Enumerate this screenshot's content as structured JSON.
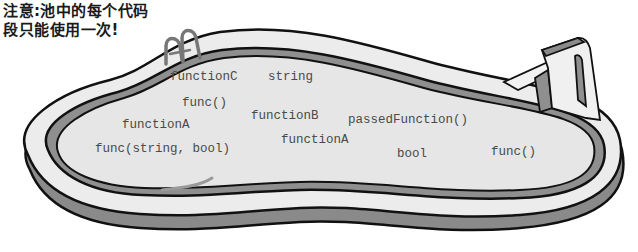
{
  "note": {
    "line1": "注意:池中的每个代码",
    "line2": "段只能使用一次!"
  },
  "pool": {
    "snippets": [
      {
        "text": "functionC",
        "x": 170,
        "y": 79
      },
      {
        "text": "string",
        "x": 268,
        "y": 79
      },
      {
        "text": "func()",
        "x": 182,
        "y": 105
      },
      {
        "text": "functionB",
        "x": 251,
        "y": 118
      },
      {
        "text": "passedFunction()",
        "x": 348,
        "y": 122
      },
      {
        "text": "functionA",
        "x": 122,
        "y": 127
      },
      {
        "text": "functionA",
        "x": 281,
        "y": 142
      },
      {
        "text": "func(string, bool)",
        "x": 95,
        "y": 151
      },
      {
        "text": "bool",
        "x": 397,
        "y": 156
      },
      {
        "text": "func()",
        "x": 491,
        "y": 154
      }
    ]
  },
  "colors": {
    "pool_water": "#e6e6e6",
    "pool_rim": "#ececec",
    "pool_shadow": "#8a8a8a",
    "outline": "#111111",
    "text": "#4a4a4a"
  }
}
